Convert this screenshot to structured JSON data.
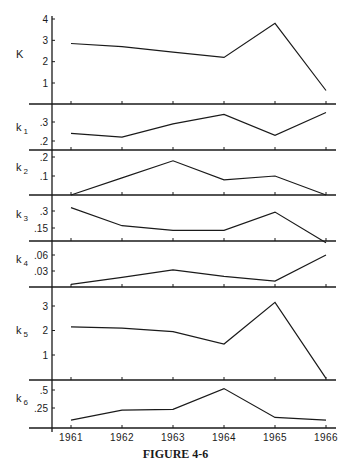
{
  "figure": {
    "caption": "FIGURE 4-6"
  },
  "chart_data": {
    "type": "line",
    "title": "",
    "caption": "FIGURE 4-6",
    "xlabel": "",
    "x": [
      "1961",
      "1962",
      "1963",
      "1964",
      "1965",
      "1966"
    ],
    "grid": false,
    "legend": "none",
    "panels": [
      {
        "name": "K",
        "label": "K",
        "subscript": "",
        "ylabel": "K",
        "yticks": [
          "1",
          "2",
          "3",
          "4"
        ],
        "ytick_values": [
          1,
          2,
          3,
          4
        ],
        "ylim": [
          0,
          4.2
        ],
        "values": [
          2.85,
          2.7,
          2.45,
          2.2,
          3.8,
          0.65
        ]
      },
      {
        "name": "k1",
        "label": "k",
        "subscript": "1",
        "ylabel": "k1",
        "yticks": [
          ".2",
          ".3"
        ],
        "ytick_values": [
          0.2,
          0.3
        ],
        "ylim": [
          0.15,
          0.37
        ],
        "values": [
          0.24,
          0.22,
          0.29,
          0.34,
          0.23,
          0.35
        ]
      },
      {
        "name": "k2",
        "label": "k",
        "subscript": "2",
        "ylabel": "k2",
        "yticks": [
          ".1",
          ".2"
        ],
        "ytick_values": [
          0.1,
          0.2
        ],
        "ylim": [
          0,
          0.21
        ],
        "values": [
          0.0,
          0.09,
          0.18,
          0.08,
          0.1,
          0.0
        ]
      },
      {
        "name": "k3",
        "label": "k",
        "subscript": "3",
        "ylabel": "k3",
        "yticks": [
          ".15",
          ".3"
        ],
        "ytick_values": [
          0.15,
          0.3
        ],
        "ylim": [
          0.02,
          0.34
        ],
        "values": [
          0.33,
          0.17,
          0.13,
          0.13,
          0.29,
          0.02
        ]
      },
      {
        "name": "k4",
        "label": "k",
        "subscript": "4",
        "ylabel": "k4",
        "yticks": [
          ".03",
          ".06"
        ],
        "ytick_values": [
          0.03,
          0.06
        ],
        "ylim": [
          0,
          0.07
        ],
        "values": [
          0.005,
          0.018,
          0.032,
          0.02,
          0.011,
          0.06
        ]
      },
      {
        "name": "k5",
        "label": "k",
        "subscript": "5",
        "ylabel": "k5",
        "yticks": [
          "1",
          "2",
          "3"
        ],
        "ytick_values": [
          1,
          2,
          3
        ],
        "ylim": [
          0,
          3.6
        ],
        "values": [
          2.15,
          2.1,
          1.95,
          1.45,
          3.15,
          0.05
        ]
      },
      {
        "name": "k6",
        "label": "k",
        "subscript": "6",
        "ylabel": "k6",
        "yticks": [
          ".25",
          ".5"
        ],
        "ytick_values": [
          0.25,
          0.5
        ],
        "ylim": [
          0,
          0.58
        ],
        "values": [
          0.08,
          0.22,
          0.23,
          0.52,
          0.12,
          0.08
        ]
      }
    ]
  },
  "layout": {
    "axis_x": 52,
    "line_left": 29,
    "line_right": 336,
    "x_positions": [
      71,
      122,
      173,
      224,
      275,
      326
    ],
    "panels": [
      {
        "top": 8,
        "base": 104,
        "y_map": [
          [
            1,
            83
          ],
          [
            4,
            19
          ]
        ],
        "label_y": 58
      },
      {
        "top": 104,
        "base": 150,
        "y_map": [
          [
            0.2,
            141
          ],
          [
            0.3,
            122
          ]
        ],
        "label_y": 131
      },
      {
        "top": 150,
        "base": 195,
        "y_map": [
          [
            0.1,
            176
          ],
          [
            0.2,
            157
          ]
        ],
        "label_y": 171
      },
      {
        "top": 195,
        "base": 241,
        "y_map": [
          [
            0.15,
            228
          ],
          [
            0.3,
            211
          ]
        ],
        "label_y": 218
      },
      {
        "top": 241,
        "base": 287,
        "y_map": [
          [
            0.03,
            271
          ],
          [
            0.06,
            255
          ]
        ],
        "label_y": 263
      },
      {
        "top": 287,
        "base": 380,
        "y_map": [
          [
            1,
            355
          ],
          [
            3,
            306
          ]
        ],
        "label_y": 334
      },
      {
        "top": 380,
        "base": 428,
        "y_map": [
          [
            0.25,
            408
          ],
          [
            0.5,
            390
          ]
        ],
        "label_y": 402
      }
    ],
    "year_label_y": 441
  }
}
